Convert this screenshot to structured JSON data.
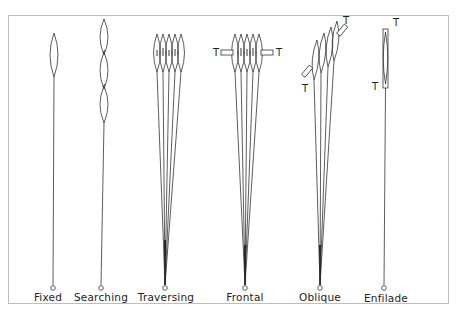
{
  "figure": {
    "target_marker": "T",
    "line_color": "#333333",
    "frame_color": "#bdbdbd"
  },
  "patterns": [
    {
      "id": "fixed",
      "label": "Fixed",
      "x": 54
    },
    {
      "id": "searching",
      "label": "Searching",
      "x": 103
    },
    {
      "id": "traversing",
      "label": "Traversing",
      "x": 165
    },
    {
      "id": "frontal",
      "label": "Frontal",
      "x": 245
    },
    {
      "id": "oblique",
      "label": "Oblique",
      "x": 320
    },
    {
      "id": "enfilade",
      "label": "Enfilade",
      "x": 384
    }
  ],
  "target_labels": {
    "frontal_left": "T",
    "frontal_right": "T",
    "oblique_lower": "T",
    "oblique_upper": "T",
    "enfilade_upper": "T",
    "enfilade_lower": "T"
  }
}
